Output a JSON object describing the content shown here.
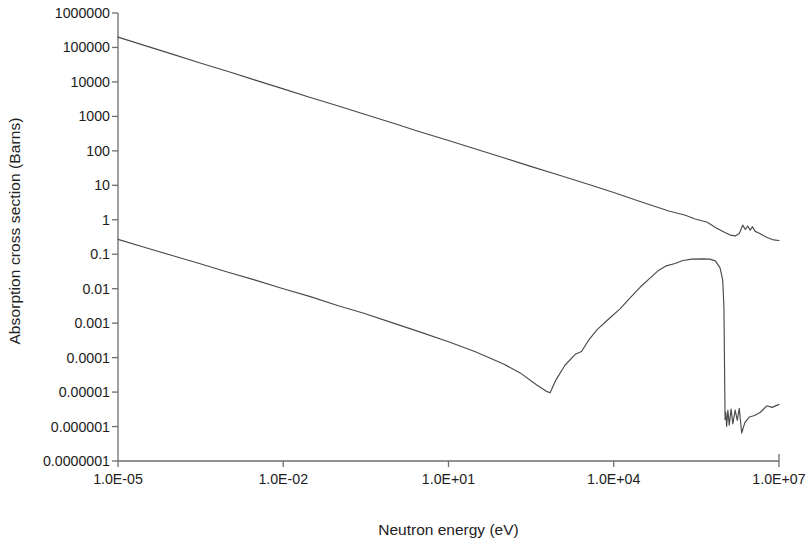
{
  "chart_data": {
    "type": "line",
    "title": "",
    "xlabel": "Neutron energy (eV)",
    "ylabel": "Absorption cross section (Barns)",
    "xscale": "log",
    "yscale": "log",
    "xlim": [
      1e-05,
      10000000.0
    ],
    "ylim": [
      1e-07,
      1000000.0
    ],
    "grid": false,
    "legend": null,
    "xtick_labels": [
      "1.0E-05",
      "1.0E-02",
      "1.0E+01",
      "1.0E+04",
      "1.0E+07"
    ],
    "xtick_values": [
      1e-05,
      0.01,
      10.0,
      10000.0,
      10000000.0
    ],
    "ytick_labels": [
      "1000000",
      "100000",
      "10000",
      "1000",
      "100",
      "10",
      "1",
      "0.1",
      "0.01",
      "0.001",
      "0.0001",
      "0.00001",
      "0.000001",
      "0.0000001"
    ],
    "ytick_values": [
      1000000.0,
      100000.0,
      10000.0,
      1000.0,
      100.0,
      10.0,
      1.0,
      0.1,
      0.01,
      0.001,
      0.0001,
      1e-05,
      1e-06,
      1e-07
    ],
    "line_color": "#4a4a4a",
    "axis_color": "#6e6e6e",
    "series": [
      {
        "name": "upper-curve",
        "points": [
          [
            1e-05,
            200000.0
          ],
          [
            3e-05,
            115000.0
          ],
          [
            0.0001,
            63000.0
          ],
          [
            0.0003,
            36000.0
          ],
          [
            0.001,
            20000.0
          ],
          [
            0.003,
            11500.0
          ],
          [
            0.01,
            6300.0
          ],
          [
            0.03,
            3600.0
          ],
          [
            0.1,
            2000.0
          ],
          [
            0.3,
            1150.0
          ],
          [
            1.0,
            630.0
          ],
          [
            3.0,
            360.0
          ],
          [
            10.0,
            200.0
          ],
          [
            30.0,
            115.0
          ],
          [
            100.0,
            63.0
          ],
          [
            300.0,
            36.0
          ],
          [
            1000.0,
            20.0
          ],
          [
            3000.0,
            11.5
          ],
          [
            10000.0,
            6.2
          ],
          [
            30000.0,
            3.4
          ],
          [
            100000.0,
            1.8
          ],
          [
            200000.0,
            1.35
          ],
          [
            300000.0,
            1.05
          ],
          [
            500000.0,
            0.85
          ],
          [
            700000.0,
            0.6
          ],
          [
            1000000.0,
            0.44
          ],
          [
            1300000.0,
            0.36
          ],
          [
            1600000.0,
            0.34
          ],
          [
            1900000.0,
            0.4
          ],
          [
            2200000.0,
            0.7
          ],
          [
            2450000.0,
            0.52
          ],
          [
            2700000.0,
            0.66
          ],
          [
            3000000.0,
            0.5
          ],
          [
            3300000.0,
            0.63
          ],
          [
            3700000.0,
            0.46
          ],
          [
            4200000.0,
            0.42
          ],
          [
            5000000.0,
            0.36
          ],
          [
            6200000.0,
            0.3
          ],
          [
            8000000.0,
            0.26
          ],
          [
            10000000.0,
            0.25
          ]
        ]
      },
      {
        "name": "lower-curve",
        "points": [
          [
            1e-05,
            0.27
          ],
          [
            3e-05,
            0.16
          ],
          [
            0.0001,
            0.09
          ],
          [
            0.0003,
            0.054
          ],
          [
            0.001,
            0.03
          ],
          [
            0.003,
            0.018
          ],
          [
            0.01,
            0.01
          ],
          [
            0.03,
            0.006
          ],
          [
            0.1,
            0.0032
          ],
          [
            0.3,
            0.0019
          ],
          [
            1.0,
            0.001
          ],
          [
            3.0,
            0.00056
          ],
          [
            10.0,
            0.00029
          ],
          [
            30.0,
            0.00015
          ],
          [
            100.0,
            6.5e-05
          ],
          [
            200.0,
            3.6e-05
          ],
          [
            400.0,
            1.6e-05
          ],
          [
            600.0,
            1.05e-05
          ],
          [
            700.0,
            9.5e-06
          ],
          [
            900.0,
            2.3e-05
          ],
          [
            1300.0,
            6e-05
          ],
          [
            2000.0,
            0.000125
          ],
          [
            2600.0,
            0.00015
          ],
          [
            3500.0,
            0.00032
          ],
          [
            5000.0,
            0.00065
          ],
          [
            8000.0,
            0.0013
          ],
          [
            13000.0,
            0.0026
          ],
          [
            20000.0,
            0.0055
          ],
          [
            30000.0,
            0.011
          ],
          [
            45000.0,
            0.02
          ],
          [
            65000.0,
            0.034
          ],
          [
            90000.0,
            0.046
          ],
          [
            130000.0,
            0.054
          ],
          [
            180000.0,
            0.066
          ],
          [
            260000.0,
            0.072
          ],
          [
            400000.0,
            0.073
          ],
          [
            550000.0,
            0.072
          ],
          [
            700000.0,
            0.064
          ],
          [
            850000.0,
            0.04
          ],
          [
            950000.0,
            0.018
          ],
          [
            1000000.0,
            0.003
          ],
          [
            1050000.0,
            1.6e-06
          ],
          [
            1080000.0,
            2.6e-06
          ],
          [
            1120000.0,
            1e-06
          ],
          [
            1180000.0,
            3e-06
          ],
          [
            1250000.0,
            1.1e-06
          ],
          [
            1350000.0,
            3.2e-06
          ],
          [
            1450000.0,
            1.2e-06
          ],
          [
            1600000.0,
            3e-06
          ],
          [
            1750000.0,
            1.5e-06
          ],
          [
            1900000.0,
            3.4e-06
          ],
          [
            2100000.0,
            6.5e-07
          ],
          [
            2400000.0,
            1.3e-06
          ],
          [
            2900000.0,
            1.9e-06
          ],
          [
            3600000.0,
            2.1e-06
          ],
          [
            4600000.0,
            2.6e-06
          ],
          [
            6000000.0,
            4e-06
          ],
          [
            7500000.0,
            3.6e-06
          ],
          [
            10000000.0,
            4.4e-06
          ]
        ]
      }
    ]
  },
  "axes": {
    "x_axis_name": "x-axis",
    "y_axis_name": "y-axis"
  }
}
